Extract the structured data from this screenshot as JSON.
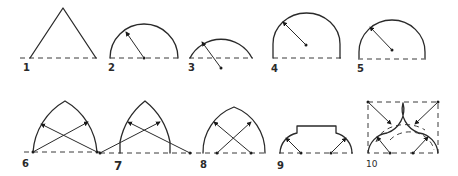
{
  "diagram": {
    "type": "arch-forms",
    "line_color": "#2a2a2a",
    "background": "#ffffff",
    "figures": [
      {
        "label": "1",
        "shape": "triangular-arch"
      },
      {
        "label": "2",
        "shape": "semicircular-arch"
      },
      {
        "label": "3",
        "shape": "segmental-arch"
      },
      {
        "label": "4",
        "shape": "stilted-arch"
      },
      {
        "label": "5",
        "shape": "horseshoe-arch"
      },
      {
        "label": "6",
        "shape": "equilateral-pointed-arch"
      },
      {
        "label": "7",
        "shape": "lancet-arch"
      },
      {
        "label": "8",
        "shape": "drop-arch"
      },
      {
        "label": "9",
        "shape": "shouldered-arch"
      },
      {
        "label": "10",
        "shape": "ogee-arch"
      }
    ]
  }
}
